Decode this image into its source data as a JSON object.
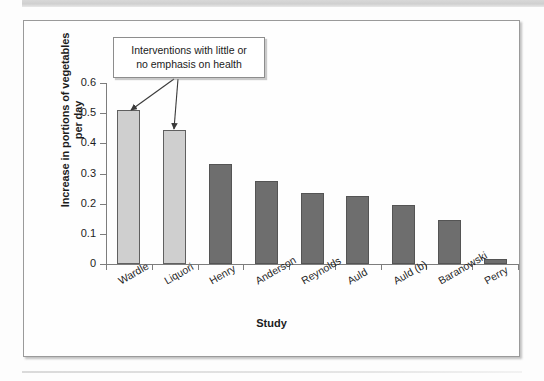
{
  "figure": {
    "annotation": {
      "line1": "Interventions with little or",
      "line2": "no emphasis on health"
    }
  },
  "chart_data": {
    "type": "bar",
    "title": "",
    "xlabel": "Study",
    "ylabel": "Increase in portions of vegetables per day",
    "ylabel_line1": "Increase in portions of vegetables",
    "ylabel_line2": "per day",
    "categories": [
      "Wardle",
      "Liquori",
      "Henry",
      "Anderson",
      "Reynolds",
      "Auld",
      "Auld (b)",
      "Baranowski",
      "Perry"
    ],
    "values": [
      0.51,
      0.445,
      0.33,
      0.275,
      0.235,
      0.227,
      0.197,
      0.147,
      0.015
    ],
    "series": [
      {
        "name": "Increase in portions of vegetables per day",
        "values": [
          0.51,
          0.445,
          0.33,
          0.275,
          0.235,
          0.227,
          0.197,
          0.147,
          0.015
        ]
      }
    ],
    "bar_styles": [
      "light",
      "light",
      "dark",
      "dark",
      "dark",
      "dark",
      "dark",
      "dark",
      "dark"
    ],
    "ylim": [
      0,
      0.6
    ],
    "ytick_labels": [
      "0.6",
      "0.5",
      "0.4",
      "0.3",
      "0.2",
      "0.1",
      "0"
    ],
    "ytick_values": [
      0.6,
      0.5,
      0.4,
      0.3,
      0.2,
      0.1,
      0
    ],
    "grid": false,
    "legend": "none",
    "annotations": [
      {
        "text": "Interventions with little or no emphasis on health",
        "points_to": [
          "Wardle",
          "Liquori"
        ]
      }
    ],
    "colors": {
      "light_bar": "#cfcfcf",
      "dark_bar": "#6e6e6e",
      "bar_outline": "#606060",
      "axis": "#7d7d7d",
      "text": "#1d1d1d"
    }
  }
}
